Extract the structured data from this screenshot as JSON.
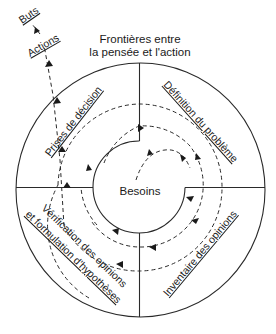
{
  "diagram": {
    "header": {
      "line1": "Frontières entre",
      "line2": "la pensée et l'action"
    },
    "center_label": "Besoins",
    "outside_labels": {
      "goals": "Buts",
      "actions": "Actions"
    },
    "quadrants": {
      "top_left": {
        "line1": "Prises de décision"
      },
      "top_right": {
        "line1": "Définition du problème"
      },
      "bottom_right": {
        "line1": "Inventaire des opinions"
      },
      "bottom_left": {
        "line1": "Vérification des opinions",
        "line2": "et formulation d'hypothèses"
      }
    },
    "colors": {
      "line": "#2a2a2a",
      "text": "#1a1a1a",
      "background": "#ffffff"
    }
  }
}
